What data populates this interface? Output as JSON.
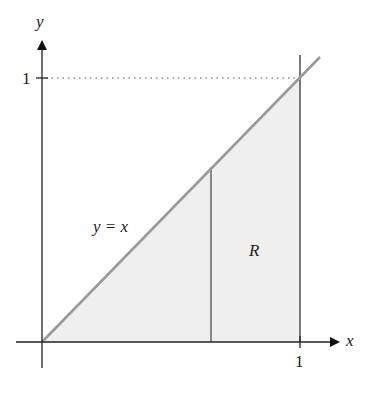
{
  "diagram": {
    "type": "region-plot",
    "axes": {
      "x_label": "x",
      "y_label": "y",
      "x_tick_label": "1",
      "y_tick_label": "1"
    },
    "curve": {
      "label": "y = x",
      "equation": "y = x",
      "color": "#9a9a9a"
    },
    "region": {
      "label": "R",
      "fill": "#efefef",
      "description": "triangle bounded by y = x, x-axis, and x = 1"
    },
    "colors": {
      "axis": "#222222",
      "dotted_guide": "#555555"
    }
  }
}
